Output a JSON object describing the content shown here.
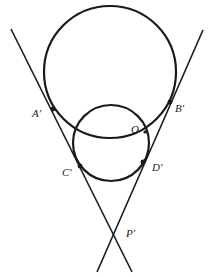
{
  "figure": {
    "type": "geometry-diagram",
    "stroke_color": "#1a1a1a",
    "background": "#ffffff",
    "circles": [
      {
        "name": "large-circle",
        "cx": 110,
        "cy": 72,
        "r": 66
      },
      {
        "name": "small-circle",
        "cx": 111,
        "cy": 143,
        "r": 38
      }
    ],
    "lines": [
      {
        "name": "left-tangent-line",
        "x1": 11,
        "y1": 29,
        "x2": 132,
        "y2": 272
      },
      {
        "name": "right-tangent-line",
        "x1": 203,
        "y1": 30,
        "x2": 97,
        "y2": 272
      }
    ],
    "points": [
      {
        "name": "A'",
        "x": 53,
        "y": 109
      },
      {
        "name": "B'",
        "x": 170,
        "y": 102
      },
      {
        "name": "C'",
        "x": 80,
        "y": 166
      },
      {
        "name": "D'",
        "x": 143,
        "y": 162
      },
      {
        "name": "O",
        "x": 145,
        "y": 132
      },
      {
        "name": "P'",
        "x": 113,
        "y": 233
      }
    ],
    "labels": {
      "A": "A′",
      "B": "B′",
      "C": "C′",
      "D": "D′",
      "O": "O",
      "P": "P′"
    }
  }
}
